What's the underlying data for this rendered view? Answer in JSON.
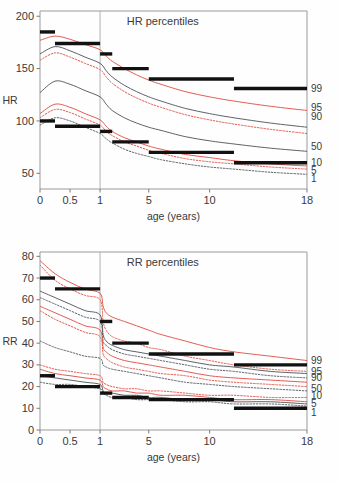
{
  "figure": {
    "panels": [
      "hr",
      "rr"
    ],
    "colors": {
      "red": "#e0493f",
      "red_light": "#e98b83",
      "dark": "#4a5158",
      "black": "#111111",
      "axis": "#9a9a9a",
      "text": "#3a3a3a"
    }
  },
  "chart_data": [
    {
      "id": "hr",
      "type": "line",
      "title": "HR percentiles",
      "xlabel": "age (years)",
      "ylabel": "HR",
      "xticks": [
        0,
        0.5,
        1,
        5,
        10,
        18
      ],
      "xticklabels": [
        "0",
        "0.5",
        "1",
        "5",
        "10",
        "18"
      ],
      "yticks": [
        50,
        100,
        150,
        200
      ],
      "yticklabels": [
        "50",
        "100",
        "150",
        "200"
      ],
      "ylim": [
        35,
        205
      ],
      "xlim": [
        0,
        18
      ],
      "xscale": "piecewise: 0-1 expanded, 1-18 compressed",
      "grid": false,
      "legend_position": "right-edge",
      "vline_at": 1,
      "x": [
        0,
        0.25,
        0.5,
        0.75,
        1,
        1.5,
        2,
        3,
        4,
        5,
        6,
        8,
        10,
        12,
        15,
        18
      ],
      "series": [
        {
          "name": "99",
          "color": "red",
          "style": "solid",
          "values": [
            177,
            181,
            178,
            173,
            168,
            162,
            157,
            150,
            144,
            139,
            135,
            128,
            123,
            119,
            114,
            110
          ]
        },
        {
          "name": "95",
          "color": "dark",
          "style": "solid",
          "values": [
            164,
            171,
            167,
            161,
            155,
            148,
            142,
            134,
            128,
            123,
            119,
            112,
            107,
            103,
            98,
            94
          ]
        },
        {
          "name": "90",
          "color": "red",
          "style": "dashed",
          "values": [
            158,
            165,
            161,
            155,
            149,
            142,
            136,
            128,
            122,
            117,
            113,
            106,
            101,
            97,
            92,
            88
          ]
        },
        {
          "name": "50",
          "color": "dark",
          "style": "solid",
          "values": [
            127,
            138,
            135,
            129,
            123,
            116,
            110,
            103,
            98,
            94,
            91,
            85,
            81,
            78,
            74,
            71
          ]
        },
        {
          "name": "10",
          "color": "red",
          "style": "solid",
          "values": [
            107,
            116,
            113,
            107,
            101,
            95,
            90,
            84,
            80,
            76,
            73,
            68,
            65,
            62,
            59,
            57
          ]
        },
        {
          "name": "5",
          "color": "red",
          "style": "dashed",
          "values": [
            103,
            111,
            108,
            102,
            96,
            90,
            86,
            80,
            76,
            72,
            69,
            64,
            61,
            59,
            56,
            54
          ]
        },
        {
          "name": "1",
          "color": "dark",
          "style": "dashed",
          "values": [
            96,
            103,
            100,
            94,
            88,
            83,
            79,
            73,
            69,
            66,
            63,
            59,
            56,
            54,
            51,
            49
          ]
        }
      ],
      "reference_bars": [
        {
          "x0": 0,
          "x1": 0.25,
          "value": 185
        },
        {
          "x0": 0.25,
          "x1": 1,
          "value": 174
        },
        {
          "x0": 1,
          "x1": 2,
          "value": 164
        },
        {
          "x0": 2,
          "x1": 5,
          "value": 150
        },
        {
          "x0": 5,
          "x1": 12,
          "value": 140
        },
        {
          "x0": 12,
          "x1": 18,
          "value": 131
        },
        {
          "x0": 0,
          "x1": 0.25,
          "value": 100
        },
        {
          "x0": 0.25,
          "x1": 1,
          "value": 95
        },
        {
          "x0": 1,
          "x1": 2,
          "value": 90
        },
        {
          "x0": 2,
          "x1": 5,
          "value": 80
        },
        {
          "x0": 5,
          "x1": 12,
          "value": 70
        },
        {
          "x0": 12,
          "x1": 18,
          "value": 60
        }
      ],
      "right_labels": [
        {
          "text": "99",
          "value": 131,
          "color": "red"
        },
        {
          "text": "95",
          "value": 113,
          "color": "dark"
        },
        {
          "text": "90",
          "value": 104,
          "color": "red"
        },
        {
          "text": "50",
          "value": 76,
          "color": "dark"
        },
        {
          "text": "10",
          "value": 60,
          "color": "red"
        },
        {
          "text": "5",
          "value": 53,
          "color": "dark"
        },
        {
          "text": "1",
          "value": 45,
          "color": "red"
        }
      ]
    },
    {
      "id": "rr",
      "type": "line",
      "title": "RR percentiles",
      "xlabel": "age (years)",
      "ylabel": "RR",
      "xticks": [
        0,
        0.5,
        1,
        5,
        10,
        18
      ],
      "xticklabels": [
        "0",
        "0.5",
        "1",
        "5",
        "10",
        "18"
      ],
      "yticks": [
        0,
        10,
        20,
        30,
        40,
        50,
        60,
        70,
        80
      ],
      "yticklabels": [
        "0",
        "10",
        "20",
        "30",
        "40",
        "50",
        "60",
        "70",
        "80"
      ],
      "ylim": [
        0,
        82
      ],
      "xlim": [
        0,
        18
      ],
      "xscale": "piecewise: 0-1 expanded, 1-18 compressed",
      "grid": false,
      "legend_position": "right-edge",
      "vline_at": 1,
      "x": [
        0,
        0.25,
        0.5,
        0.75,
        1,
        1.25,
        1.5,
        2,
        3,
        4,
        5,
        6,
        8,
        10,
        12,
        15,
        18
      ],
      "series": [
        {
          "name": "99",
          "color": "red",
          "style": "solid",
          "values": [
            78,
            72,
            68,
            65,
            63,
            57,
            54,
            52,
            50,
            48,
            46,
            44,
            41,
            38,
            36,
            34,
            32
          ]
        },
        {
          "name": "95",
          "color": "red",
          "style": "dashed",
          "values": [
            76,
            69,
            65,
            62,
            60,
            50,
            46,
            43,
            41,
            40,
            38,
            37,
            34,
            32,
            30,
            28,
            27
          ]
        },
        {
          "name": "90",
          "color": "dark",
          "style": "solid",
          "values": [
            64,
            61,
            58,
            55,
            53,
            44,
            41,
            39,
            37,
            36,
            35,
            34,
            32,
            30,
            29,
            27,
            26
          ]
        },
        {
          "name": "50",
          "color": "dark",
          "style": "dashed",
          "values": [
            61,
            58,
            55,
            52,
            50,
            41,
            39,
            37,
            35,
            34,
            33,
            32,
            30,
            28,
            27,
            25,
            24
          ]
        },
        {
          "name": "10",
          "color": "red",
          "style": "solid",
          "values": [
            57,
            54,
            51,
            48,
            46,
            38,
            36,
            34,
            32,
            31,
            30,
            29,
            27,
            25,
            24,
            23,
            22
          ]
        },
        {
          "name": "5",
          "color": "red",
          "style": "dashed",
          "values": [
            55,
            51,
            48,
            45,
            43,
            35,
            33,
            31,
            29,
            28,
            27,
            26,
            25,
            23,
            22,
            21,
            20
          ]
        },
        {
          "name": "1",
          "color": "dark",
          "style": "dashed",
          "values": [
            41,
            38,
            36,
            34,
            33,
            30,
            29,
            28,
            27,
            26,
            25,
            24,
            22,
            21,
            20,
            19,
            18
          ]
        },
        {
          "name": "lower-90",
          "color": "red",
          "style": "dashed",
          "values": [
            30,
            28,
            27,
            26,
            25,
            22,
            21,
            20,
            19,
            19,
            18,
            18,
            17,
            16,
            16,
            15,
            15
          ]
        },
        {
          "name": "lower-50",
          "color": "red",
          "style": "solid",
          "values": [
            28,
            26,
            25,
            24,
            23,
            20,
            19,
            18,
            18,
            17,
            17,
            16,
            16,
            15,
            14,
            14,
            13
          ]
        },
        {
          "name": "lower-10",
          "color": "dark",
          "style": "solid",
          "values": [
            25,
            24,
            23,
            22,
            21,
            18,
            17,
            17,
            16,
            16,
            15,
            15,
            14,
            14,
            13,
            13,
            12
          ]
        },
        {
          "name": "lower-5",
          "color": "dark",
          "style": "dashed",
          "values": [
            22,
            21,
            21,
            20,
            19,
            17,
            16,
            15,
            15,
            14,
            14,
            14,
            13,
            13,
            12,
            12,
            11
          ]
        }
      ],
      "reference_bars": [
        {
          "x0": 0,
          "x1": 0.25,
          "value": 70
        },
        {
          "x0": 0.25,
          "x1": 1,
          "value": 65
        },
        {
          "x0": 1,
          "x1": 2,
          "value": 50
        },
        {
          "x0": 2,
          "x1": 5,
          "value": 40
        },
        {
          "x0": 5,
          "x1": 12,
          "value": 35
        },
        {
          "x0": 12,
          "x1": 18,
          "value": 30
        },
        {
          "x0": 0,
          "x1": 0.25,
          "value": 25
        },
        {
          "x0": 0.25,
          "x1": 1,
          "value": 20
        },
        {
          "x0": 1,
          "x1": 2,
          "value": 17
        },
        {
          "x0": 2,
          "x1": 5,
          "value": 15
        },
        {
          "x0": 5,
          "x1": 12,
          "value": 14
        },
        {
          "x0": 12,
          "x1": 18,
          "value": 10
        }
      ],
      "right_labels": [
        {
          "text": "99",
          "value": 32,
          "color": "red"
        },
        {
          "text": "95",
          "value": 27,
          "color": "dark"
        },
        {
          "text": "90",
          "value": 24,
          "color": "red"
        },
        {
          "text": "50",
          "value": 19,
          "color": "dark"
        },
        {
          "text": "10",
          "value": 16,
          "color": "red"
        },
        {
          "text": "5",
          "value": 12,
          "color": "dark"
        },
        {
          "text": "1",
          "value": 8,
          "color": "red"
        }
      ]
    }
  ]
}
